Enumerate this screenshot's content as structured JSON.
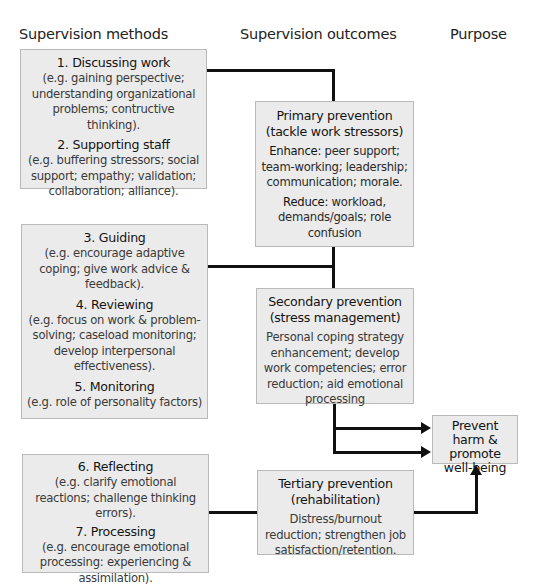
{
  "headers": {
    "methods": "Supervision methods",
    "outcomes": "Supervision outcomes",
    "purpose": "Purpose"
  },
  "methods": [
    {
      "items": [
        {
          "title": "1. Discussing work",
          "body": "(e.g. gaining perspective; understanding organizational problems; contructive thinking)."
        },
        {
          "title": "2. Supporting staff",
          "body": "(e.g. buffering stressors; social support; empathy; validation; collaboration; alliance)."
        }
      ]
    },
    {
      "items": [
        {
          "title": "3. Guiding",
          "body": "(e.g. encourage adaptive coping; give work advice & feedback)."
        },
        {
          "title": "4. Reviewing",
          "body": "(e.g. focus on work & problem-solving; caseload monitoring; develop interpersonal effectiveness)."
        },
        {
          "title": "5. Monitoring",
          "body": "(e.g. role of personality factors)"
        }
      ]
    },
    {
      "items": [
        {
          "title": "6. Reflecting",
          "body": "(e.g. clarify emotional reactions; challenge thinking errors)."
        },
        {
          "title": "7. Processing",
          "body": "(e.g. encourage emotional processing: experiencing & assimilation)."
        }
      ]
    }
  ],
  "outcomes": {
    "primary": {
      "title": "Primary prevention",
      "subtitle": "(tackle work stressors)",
      "enhance_label": "Enhance:",
      "enhance_text": "peer support; team-working; leadership; communication; morale.",
      "reduce_label": "Reduce:",
      "reduce_text": "workload, demands/goals; role confusion"
    },
    "secondary": {
      "title": "Secondary prevention",
      "subtitle": "(stress management)",
      "body": "Personal coping strategy enhancement; develop work competencies; error reduction; aid emotional processing"
    },
    "tertiary": {
      "title": "Tertiary prevention",
      "subtitle": "(rehabilitation)",
      "body": "Distress/burnout reduction; strengthen job satisfaction/retention."
    }
  },
  "purpose": {
    "label": "Prevent harm & promote well-being"
  },
  "colors": {
    "box_fill": "#ebebeb",
    "box_border": "#b9b9b9",
    "connector": "#111111"
  }
}
